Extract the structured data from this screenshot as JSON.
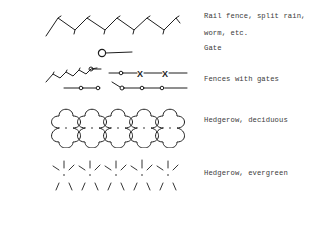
{
  "legend": {
    "entries": [
      {
        "id": "rail-fence",
        "symbol": "zigzag-fence-symbol",
        "label_lines": [
          "Rail fence, split rain,",
          "worm, etc."
        ]
      },
      {
        "id": "gate",
        "symbol": "gate-symbol",
        "label_lines": [
          "Gate"
        ]
      },
      {
        "id": "fences-with-gates",
        "symbol": "fence-with-gates-symbol",
        "label_lines": [
          "Fences with gates"
        ]
      },
      {
        "id": "hedgerow-deciduous",
        "symbol": "deciduous-hedgerow-symbol",
        "label_lines": [
          "Hedgerow, deciduous"
        ]
      },
      {
        "id": "hedgerow-evergreen",
        "symbol": "evergreen-hedgerow-symbol",
        "label_lines": [
          "Hedgerow, evergreen"
        ]
      }
    ]
  },
  "colors": {
    "background": "#ffffff",
    "ink": "#1e1e1e",
    "text": "#3a3a3a"
  }
}
